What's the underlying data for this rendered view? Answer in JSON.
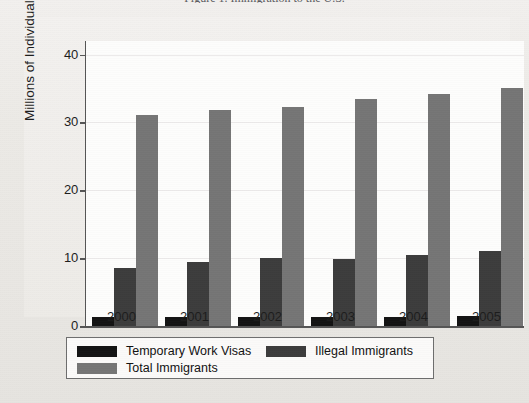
{
  "caption": "Figure 1. Immigration to the U.S.",
  "chart_data": {
    "type": "bar",
    "title": "",
    "subtitle": "",
    "xlabel": "",
    "ylabel": "Millions of Individuals",
    "categories": [
      "2000",
      "2001",
      "2002",
      "2003",
      "2004",
      "2005"
    ],
    "ylim": [
      0,
      42
    ],
    "yticks": [
      0,
      10,
      20,
      30,
      40
    ],
    "ytick_labels": [
      "0",
      "10",
      "20",
      "30",
      "40"
    ],
    "grid": true,
    "legend_position": "bottom",
    "series": [
      {
        "name": "Temporary Work Visas",
        "color": "#131313",
        "values": [
          1.3,
          1.4,
          1.3,
          1.3,
          1.4,
          1.5
        ]
      },
      {
        "name": "Illegal Immigrants",
        "color": "#3c3c3c",
        "values": [
          8.5,
          9.4,
          10.0,
          9.9,
          10.5,
          11.1
        ]
      },
      {
        "name": "Total Immigrants",
        "color": "#757575",
        "values": [
          31.1,
          31.8,
          32.3,
          33.4,
          34.2,
          35.1
        ]
      }
    ]
  }
}
